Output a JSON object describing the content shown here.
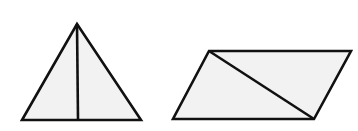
{
  "canvas": {
    "width": 358,
    "height": 131,
    "background": "#ffffff"
  },
  "style": {
    "stroke": "#111111",
    "fill": "#f2f2f2",
    "stroke_width": 2.6
  },
  "shapes": [
    {
      "name": "triangle",
      "kind": "isosceles-triangle",
      "points": [
        [
          77,
          24
        ],
        [
          141,
          120
        ],
        [
          22,
          120
        ]
      ],
      "divider": {
        "name": "triangle-median",
        "from": [
          77,
          24
        ],
        "to": [
          78,
          120
        ]
      }
    },
    {
      "name": "parallelogram",
      "kind": "parallelogram",
      "points": [
        [
          209,
          51
        ],
        [
          351,
          51
        ],
        [
          314,
          119
        ],
        [
          173,
          119
        ]
      ],
      "divider": {
        "name": "parallelogram-diagonal",
        "from": [
          209,
          51
        ],
        "to": [
          314,
          119
        ]
      }
    }
  ]
}
